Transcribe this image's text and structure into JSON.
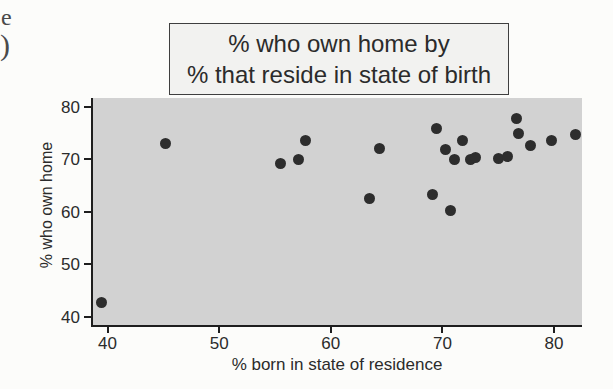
{
  "page": {
    "margin_fragments": {
      "fragment_1": "e",
      "fragment_2": ")"
    }
  },
  "chart_data": {
    "type": "scatter",
    "title_line1": "% who own home by",
    "title_line2": "% that reside in state of birth",
    "xlabel": "% born in state of residence",
    "ylabel": "% who own home",
    "xlim": [
      38.7,
      82.5
    ],
    "ylim": [
      38.4,
      81.7
    ],
    "x_ticks": [
      40,
      50,
      60,
      70,
      80
    ],
    "y_ticks": [
      40,
      50,
      60,
      70,
      80
    ],
    "grid": false,
    "legend_position": "none",
    "points": [
      [
        39.5,
        42.6
      ],
      [
        45.2,
        73.0
      ],
      [
        55.5,
        69.2
      ],
      [
        57.1,
        69.9
      ],
      [
        57.7,
        73.5
      ],
      [
        63.5,
        62.6
      ],
      [
        64.4,
        72.1
      ],
      [
        69.1,
        63.2
      ],
      [
        69.5,
        75.9
      ],
      [
        70.3,
        71.9
      ],
      [
        70.7,
        60.2
      ],
      [
        71.1,
        70.0
      ],
      [
        71.8,
        73.5
      ],
      [
        72.5,
        69.9
      ],
      [
        73.0,
        70.4
      ],
      [
        75.0,
        70.2
      ],
      [
        75.8,
        70.6
      ],
      [
        76.6,
        77.7
      ],
      [
        76.8,
        75.0
      ],
      [
        77.9,
        72.7
      ],
      [
        79.8,
        73.6
      ],
      [
        81.9,
        74.7
      ]
    ],
    "colors": {
      "plot_background": "#d2d2d2",
      "marker": "#2d2d2d",
      "axis": "#1e1e1e",
      "title_box_background": "#f2f2f0",
      "page_background": "#fcfcfa",
      "text": "#2b2b2b"
    }
  }
}
